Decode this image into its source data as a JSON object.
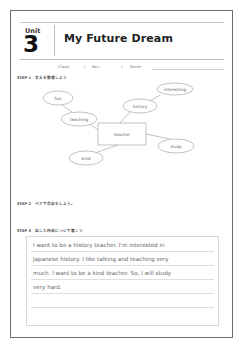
{
  "worksheet": {
    "unit_label": "Unit",
    "unit_number": "3",
    "title": "My Future Dream",
    "meta": {
      "class_label": "Class(",
      "class_close": ")",
      "no_label": "No.(",
      "no_close": ")",
      "name_label": "Name"
    },
    "steps": [
      {
        "label": "STEP 1　考えを整理しよう"
      },
      {
        "label": "STEP 2　ペアで会話をしよう。"
      },
      {
        "label": "STEP 3　話した内容について書こう"
      }
    ],
    "mind_map": {
      "center": "teacher",
      "nodes": [
        "fun",
        "interesting",
        "history",
        "teaching",
        "study",
        "kind"
      ]
    },
    "writing": {
      "lines": [
        "I want to be a history teacher. I'm interested in",
        "Japanese history. I like talking and teaching very",
        "much. I want to be a kind teacher. So, I will study",
        "very hard.",
        "",
        ""
      ]
    }
  }
}
